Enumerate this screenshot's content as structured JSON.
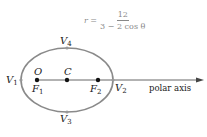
{
  "formula": {
    "lhs": "r =",
    "numerator": "12",
    "denominator": "3 − 2 cos θ"
  },
  "labels": {
    "v1": "V",
    "v1_sub": "1",
    "v2": "V",
    "v2_sub": "2",
    "v3": "V",
    "v3_sub": "3",
    "v4": "V",
    "v4_sub": "4",
    "o": "O",
    "c": "C",
    "f1": "F",
    "f1_sub": "1",
    "f2": "F",
    "f2_sub": "2",
    "polar_axis": "polar axis"
  },
  "colors": {
    "ellipse": "#8a8a8a",
    "axis": "#555555",
    "points": "#111111",
    "text": "#222222"
  }
}
